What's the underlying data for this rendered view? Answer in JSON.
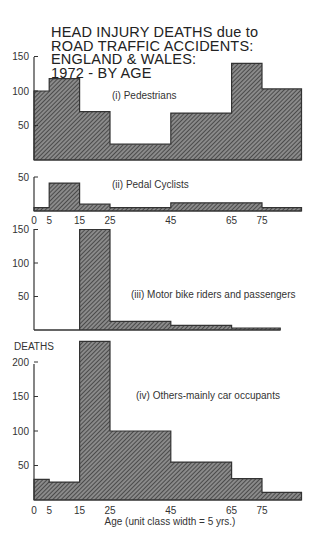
{
  "title_lines": [
    "HEAD INJURY DEATHS due to",
    "ROAD TRAFFIC ACCIDENTS:",
    "ENGLAND & WALES:",
    "1972 - BY AGE"
  ],
  "xlabel": "Age (unit class width = 5 yrs.)",
  "ylabel": "DEATHS",
  "x_ticks": [
    "0",
    "5",
    "15",
    "25",
    "45",
    "65",
    "75"
  ],
  "colors": {
    "bar_fill": "#6a6a6a",
    "hatch": "#3a3a3a",
    "outline": "#333333"
  },
  "chart_data": [
    {
      "type": "bar",
      "title": "(i) Pedestrians",
      "xlabel": "Age",
      "ylabel": "Deaths (per 5-yr class)",
      "bins": [
        [
          0,
          5
        ],
        [
          5,
          15
        ],
        [
          15,
          25
        ],
        [
          25,
          45
        ],
        [
          45,
          65
        ],
        [
          65,
          75
        ],
        [
          75,
          88
        ]
      ],
      "categories": [
        "0-5",
        "5-15",
        "15-25",
        "25-45",
        "45-65",
        "65-75",
        "75+"
      ],
      "values": [
        100,
        118,
        70,
        23,
        68,
        140,
        103
      ],
      "y_ticks": [
        50,
        100,
        150
      ],
      "ylim": [
        0,
        150
      ]
    },
    {
      "type": "bar",
      "title": "(ii) Pedal Cyclists",
      "xlabel": "Age",
      "ylabel": "Deaths (per 5-yr class)",
      "bins": [
        [
          0,
          5
        ],
        [
          5,
          15
        ],
        [
          15,
          25
        ],
        [
          25,
          45
        ],
        [
          45,
          75
        ],
        [
          75,
          88
        ]
      ],
      "categories": [
        "0-5",
        "5-15",
        "15-25",
        "25-45",
        "45-75",
        "75+"
      ],
      "values": [
        5,
        41,
        10,
        5,
        12,
        5
      ],
      "y_ticks": [
        50
      ],
      "ylim": [
        0,
        50
      ]
    },
    {
      "type": "bar",
      "title": "(iii) Motor bike riders and passengers",
      "xlabel": "Age",
      "ylabel": "Deaths (per 5-yr class)",
      "bins": [
        [
          0,
          15
        ],
        [
          15,
          25
        ],
        [
          25,
          45
        ],
        [
          45,
          65
        ],
        [
          65,
          81
        ]
      ],
      "categories": [
        "0-15",
        "15-25",
        "25-45",
        "45-65",
        "65+"
      ],
      "values": [
        0,
        150,
        13,
        7,
        3
      ],
      "y_ticks": [
        50,
        100,
        150
      ],
      "ylim": [
        0,
        150
      ]
    },
    {
      "type": "bar",
      "title": "(iv) Others-mainly car occupants",
      "xlabel": "Age (unit class width = 5 yrs.)",
      "ylabel": "DEATHS",
      "bins": [
        [
          0,
          5
        ],
        [
          5,
          15
        ],
        [
          15,
          25
        ],
        [
          25,
          45
        ],
        [
          45,
          65
        ],
        [
          65,
          75
        ],
        [
          75,
          88
        ]
      ],
      "categories": [
        "0-5",
        "5-15",
        "15-25",
        "25-45",
        "45-65",
        "65-75",
        "75+"
      ],
      "values": [
        30,
        26,
        230,
        100,
        55,
        31,
        11
      ],
      "y_ticks": [
        50,
        100,
        150,
        200
      ],
      "ylim": [
        0,
        230
      ]
    }
  ],
  "panels": [
    {
      "label": "(i) Pedestrians"
    },
    {
      "label": "(ii) Pedal Cyclists"
    },
    {
      "label": "(iii) Motor bike riders and passengers"
    },
    {
      "label": "(iv) Others-mainly car occupants"
    }
  ]
}
